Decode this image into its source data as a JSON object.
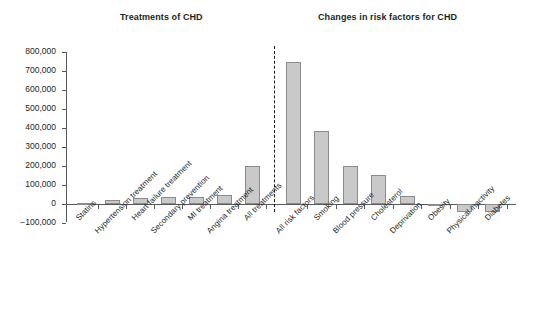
{
  "titles": {
    "left": "Treatments of CHD",
    "right": "Changes in risk factors for CHD"
  },
  "axis": {
    "y_ticks": [
      "800,000",
      "700,000",
      "600,000",
      "500,000",
      "400,000",
      "300,000",
      "200,000",
      "100,000",
      "0",
      "−100,000"
    ]
  },
  "colors": {
    "bar_fill": "#c9c9c9",
    "bar_stroke": "#8b8b8b",
    "axis": "#58595b",
    "text": "#231f20",
    "divider": "#1a1a1a"
  },
  "chart_data": {
    "type": "bar",
    "title": "",
    "xlabel": "",
    "ylabel": "",
    "ylim": [
      -100000,
      800000
    ],
    "ytick_step": 100000,
    "grid": false,
    "legend": null,
    "groups": [
      {
        "name": "Treatments of CHD",
        "categories": [
          "Statins",
          "Hypertension treatment",
          "Heart failure treatment",
          "Secondary prevention",
          "MI treatment",
          "Angina treatment",
          "All treatments"
        ],
        "values": [
          5000,
          22000,
          30000,
          38000,
          37000,
          45000,
          200000
        ]
      },
      {
        "name": "Changes in risk factors for CHD",
        "categories": [
          "All risk factors",
          "Smoking",
          "Blood pressure",
          "Cholesterol",
          "Deprivation",
          "Obesity",
          "Physical inactivity",
          "Diabetes"
        ],
        "values": [
          745000,
          385000,
          200000,
          155000,
          40000,
          -5000,
          -40000,
          -40000
        ]
      }
    ]
  }
}
